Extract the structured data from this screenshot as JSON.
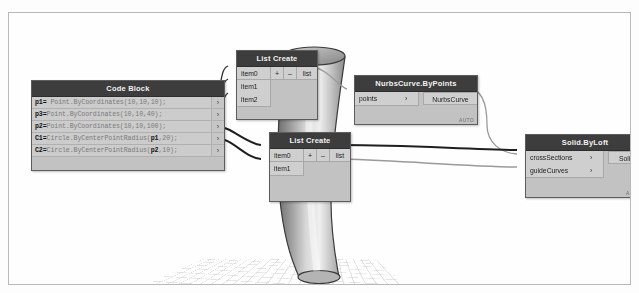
{
  "app": {
    "name": "Dynamo Visual Programming Canvas",
    "canvas_background": "#fdfdfd",
    "node_header_color": "#3d3d3d",
    "node_body_color": "#c2c2c2"
  },
  "nodes": {
    "code_block": {
      "title": "Code Block",
      "lines": [
        {
          "var": "p1=",
          "expr": " Point.ByCoordinates(",
          "args": "10,10,10",
          "tail": ");"
        },
        {
          "var": "p3=",
          "expr": "Point.ByCoordinates(",
          "args": "10,10,40",
          "tail": ");"
        },
        {
          "var": "p2=",
          "expr": "Point.ByCoordinates(",
          "args": "10,10,100",
          "tail": ");"
        },
        {
          "var": "C1=",
          "expr": "Circle.ByCenterPointRadius(p1,",
          "args": "20",
          "tail": ");"
        },
        {
          "var": "C2=",
          "expr": "Circle.ByCenterPointRadius(p2,",
          "args": "10",
          "tail": ");"
        }
      ],
      "output_marker": "›"
    },
    "list_create_1": {
      "title": "List Create",
      "inputs": [
        "item0",
        "item1",
        "item2"
      ],
      "add_label": "+",
      "remove_label": "–",
      "output": "list"
    },
    "list_create_2": {
      "title": "List Create",
      "inputs": [
        "item0",
        "item1"
      ],
      "add_label": "+",
      "remove_label": "–",
      "output": "list"
    },
    "nurbs_curve": {
      "title": "NurbsCurve.ByPoints",
      "inputs": [
        "points"
      ],
      "output": "NurbsCurve",
      "run_mode": "AUTO",
      "chevron": "›"
    },
    "solid_by_loft": {
      "title": "Solid.ByLoft",
      "inputs": [
        "crossSections",
        "guideCurves"
      ],
      "output": "Solid",
      "run_mode": "AUTO",
      "chevron": "›"
    }
  },
  "viewport": {
    "geometry_label": "lofted-solid",
    "ground_label": "ground-grid"
  }
}
